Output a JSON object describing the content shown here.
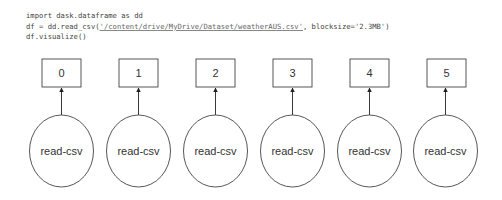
{
  "code": {
    "line1": "import dask.dataframe as dd",
    "line2_pre": "df = dd.read_csv(",
    "line2_path": "'/content/drive/MyDrive/Dataset/weatherAUS.csv'",
    "line2_post": ", blocksize='2.3MB')",
    "line3": "df.visualize()"
  },
  "graph": {
    "partitions": [
      {
        "output": "0",
        "task": "read-csv"
      },
      {
        "output": "1",
        "task": "read-csv"
      },
      {
        "output": "2",
        "task": "read-csv"
      },
      {
        "output": "3",
        "task": "read-csv"
      },
      {
        "output": "4",
        "task": "read-csv"
      },
      {
        "output": "5",
        "task": "read-csv"
      }
    ]
  }
}
